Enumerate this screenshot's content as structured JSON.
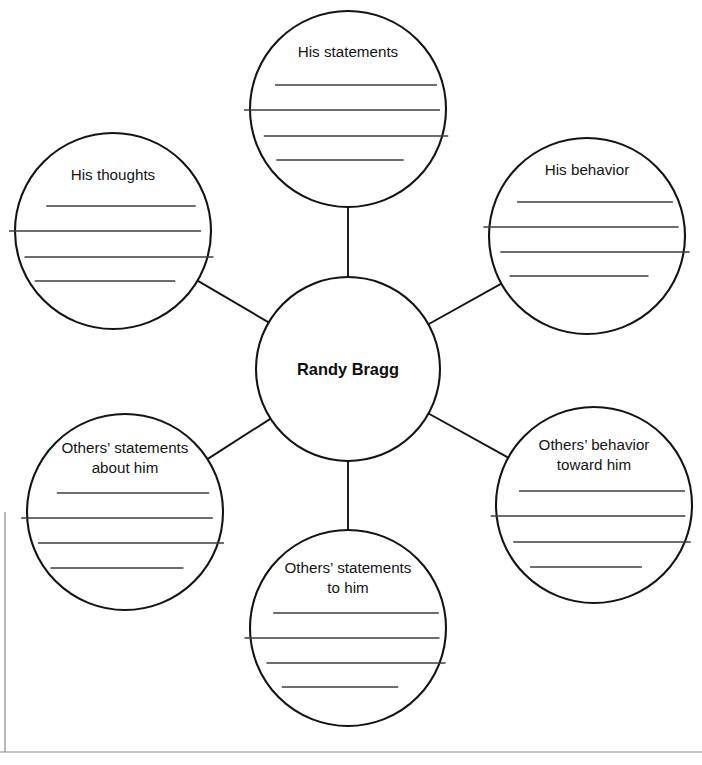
{
  "diagram": {
    "type": "character-web-organizer",
    "center": {
      "label": "Randy Bragg",
      "cx": 348,
      "cy": 369,
      "r": 92
    },
    "line_color": "#141414",
    "rule_color": "#3d3d3d",
    "background": "#ffffff",
    "nodes": [
      {
        "id": "his-statements",
        "label": "His statements",
        "lines": [
          "His statements"
        ],
        "cx": 348,
        "cy": 109,
        "r": 98,
        "text_y": 57,
        "rule_ys": [
          85,
          110,
          136,
          160
        ],
        "rule_insets": [
          22,
          6,
          10,
          28
        ],
        "blank_lines": 4
      },
      {
        "id": "his-behavior",
        "label": "His behavior",
        "lines": [
          "His behavior"
        ],
        "cx": 587,
        "cy": 236,
        "r": 98,
        "text_y": 175,
        "rule_ys": [
          202,
          227,
          252,
          276
        ],
        "rule_insets": [
          22,
          6,
          10,
          28
        ],
        "blank_lines": 4
      },
      {
        "id": "others-behavior-toward-him",
        "label": "Others’ behavior toward him",
        "lines": [
          "Others’ behavior",
          "toward him"
        ],
        "cx": 594,
        "cy": 505,
        "r": 98,
        "text_y": 450,
        "rule_ys": [
          491,
          516,
          542,
          567
        ],
        "rule_insets": [
          22,
          6,
          10,
          28
        ],
        "blank_lines": 4
      },
      {
        "id": "others-statements-to-him",
        "label": "Others’ statements to him",
        "lines": [
          "Others’ statements",
          "to him"
        ],
        "cx": 348,
        "cy": 628,
        "r": 98,
        "text_y": 573,
        "rule_ys": [
          613,
          638,
          663,
          687
        ],
        "rule_insets": [
          22,
          6,
          10,
          28
        ],
        "blank_lines": 4
      },
      {
        "id": "others-statements-about-him",
        "label": "Others’ statements about him",
        "lines": [
          "Others’ statements",
          "about him"
        ],
        "cx": 125,
        "cy": 512,
        "r": 98,
        "text_y": 453,
        "rule_ys": [
          493,
          518,
          543,
          568
        ],
        "rule_insets": [
          28,
          10,
          6,
          22
        ],
        "blank_lines": 4
      },
      {
        "id": "his-thoughts",
        "label": "His thoughts",
        "lines": [
          "His thoughts"
        ],
        "cx": 113,
        "cy": 231,
        "r": 98,
        "text_y": 180,
        "rule_ys": [
          206,
          231,
          257,
          281
        ],
        "rule_insets": [
          28,
          10,
          6,
          22
        ],
        "blank_lines": 4
      }
    ],
    "connectors": [
      {
        "id": "center-to-his-statements",
        "from": "center",
        "to": "his-statements"
      },
      {
        "id": "center-to-his-behavior",
        "from": "center",
        "to": "his-behavior"
      },
      {
        "id": "center-to-others-behavior-toward-him",
        "from": "center",
        "to": "others-behavior-toward-him"
      },
      {
        "id": "center-to-others-statements-to-him",
        "from": "center",
        "to": "others-statements-to-him"
      },
      {
        "id": "center-to-others-statements-about-him",
        "from": "center",
        "to": "others-statements-about-him"
      },
      {
        "id": "center-to-his-thoughts",
        "from": "center",
        "to": "his-thoughts"
      }
    ],
    "page_rules": {
      "left_vertical": {
        "x": 5,
        "y1": 512,
        "y2": 752
      },
      "bottom_horizontal": {
        "x1": 0,
        "x2": 702,
        "y": 752
      }
    }
  }
}
